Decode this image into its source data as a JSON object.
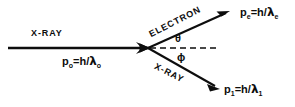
{
  "figure": {
    "kind": "compton-scattering-diagram",
    "background_color": "#ffffff",
    "ink_color": "#0d0d0d",
    "width": 295,
    "height": 107
  },
  "incident": {
    "ray_label": "X-RAY",
    "momentum": {
      "symbol": "p",
      "symbol_subscript": "o",
      "equals": "=",
      "numerator": "h",
      "slash": "/",
      "lambda": "λ",
      "lambda_subscript": "o",
      "full_text": "p₀=h/λ₀"
    },
    "arrow": {
      "from_x": 8,
      "from_y": 48,
      "to_x": 148,
      "to_y": 48,
      "head": "open-barbed"
    }
  },
  "scattered_electron": {
    "ray_label": "ELECTRON",
    "momentum": {
      "symbol": "p",
      "symbol_subscript": "e",
      "equals": "=",
      "numerator": "h",
      "slash": "/",
      "lambda": "λ",
      "lambda_subscript": "e",
      "full_text": "pₑ=h/λₑ"
    },
    "arrow": {
      "from_x": 148,
      "from_y": 48,
      "to_x": 228,
      "to_y": 12,
      "head": "solid"
    }
  },
  "scattered_xray": {
    "ray_label": "X-RAY",
    "momentum": {
      "symbol": "p",
      "symbol_subscript": "1",
      "equals": "=",
      "numerator": "h",
      "slash": "/",
      "lambda": "λ",
      "lambda_subscript": "1",
      "full_text": "p₁=h/λ₁"
    },
    "arrow": {
      "from_x": 148,
      "from_y": 48,
      "to_x": 219,
      "to_y": 89,
      "head": "solid"
    }
  },
  "axis": {
    "style": "dashed",
    "from_x": 148,
    "from_y": 48,
    "to_x": 216,
    "to_y": 48
  },
  "angles": {
    "theta": {
      "glyph": "θ",
      "name": "scattering-angle-electron"
    },
    "phi": {
      "glyph": "ϕ",
      "name": "scattering-angle-xray"
    }
  }
}
